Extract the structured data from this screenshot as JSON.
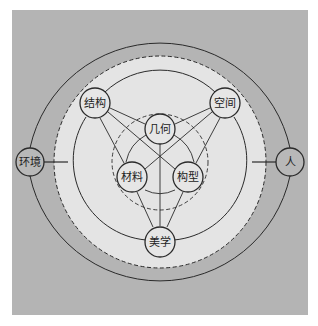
{
  "diagram": {
    "colors": {
      "outer_background": "#b4b4b4",
      "inner_disc": "#e4e4e4",
      "node_fill": "#e8e8e8",
      "stroke": "#2a2a2a"
    },
    "nodes": {
      "environment": {
        "label": "环境",
        "x": 30,
        "y": 162
      },
      "human": {
        "label": "人",
        "x": 290,
        "y": 162
      },
      "structure": {
        "label": "结构",
        "x": 95,
        "y": 103
      },
      "space": {
        "label": "空间",
        "x": 225,
        "y": 103
      },
      "aesthetics": {
        "label": "美学",
        "x": 160,
        "y": 242
      },
      "geometry": {
        "label": "几何",
        "x": 160,
        "y": 129
      },
      "material": {
        "label": "材料",
        "x": 132,
        "y": 177
      },
      "configuration": {
        "label": "构型",
        "x": 188,
        "y": 177
      }
    },
    "edges": [
      {
        "from": "环境",
        "to": "人",
        "type": "outer-arc-top"
      },
      {
        "from": "人",
        "to": "环境",
        "type": "outer-arc-bottom"
      },
      {
        "from": "环境",
        "to": "inner-domain",
        "type": "arrow"
      },
      {
        "from": "人",
        "to": "inner-domain",
        "type": "arrow"
      },
      {
        "from": "结构",
        "to": "空间",
        "type": "arc"
      },
      {
        "from": "空间",
        "to": "美学",
        "type": "arc"
      },
      {
        "from": "美学",
        "to": "结构",
        "type": "arc"
      },
      {
        "from": "结构",
        "to": "几何",
        "type": "bidirectional"
      },
      {
        "from": "空间",
        "to": "几何",
        "type": "bidirectional"
      },
      {
        "from": "结构",
        "to": "构型",
        "type": "bidirectional"
      },
      {
        "from": "空间",
        "to": "材料",
        "type": "bidirectional"
      },
      {
        "from": "几何",
        "to": "美学",
        "type": "arrow"
      },
      {
        "from": "材料",
        "to": "美学",
        "type": "arrow"
      },
      {
        "from": "构型",
        "to": "美学",
        "type": "arrow"
      },
      {
        "from": "几何",
        "to": "材料",
        "type": "arc"
      },
      {
        "from": "几何",
        "to": "构型",
        "type": "arc"
      },
      {
        "from": "材料",
        "to": "构型",
        "type": "arc"
      }
    ]
  }
}
